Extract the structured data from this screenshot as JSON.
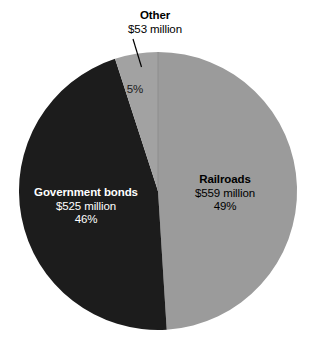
{
  "chart_data": {
    "type": "pie",
    "title": "",
    "subtitle": "",
    "xlabel": "",
    "ylabel": "",
    "legend_position": "none",
    "grid": false,
    "units": "million USD",
    "total_value": 1137,
    "start_angle_deg": 0,
    "direction": "clockwise",
    "categories": [
      "Railroads",
      "Government bonds",
      "Other"
    ],
    "values": [
      559,
      525,
      53
    ],
    "percentages": [
      49,
      46,
      5
    ],
    "colors": [
      "#9b9b9b",
      "#1c1c1c",
      "#a2a2a2"
    ],
    "slices": [
      {
        "name": "Railroads",
        "value": 559,
        "value_label": "$559 million",
        "percent": 49,
        "percent_label": "49%",
        "color": "#9b9b9b",
        "label_color": "#000000",
        "label_placement": "inside"
      },
      {
        "name": "Government bonds",
        "value": 525,
        "value_label": "$525 million",
        "percent": 46,
        "percent_label": "46%",
        "color": "#1c1c1c",
        "label_color": "#ffffff",
        "label_placement": "inside"
      },
      {
        "name": "Other",
        "value": 53,
        "value_label": "$53 million",
        "percent": 5,
        "percent_label": "5%",
        "color": "#a2a2a2",
        "label_color": "#000000",
        "label_placement": "outside-with-leader-line"
      }
    ]
  },
  "labels": {
    "other": {
      "title": "Other",
      "value": "$53 million",
      "percent": "5%"
    },
    "railroads": {
      "title": "Railroads",
      "value": "$559 million",
      "percent": "49%"
    },
    "government_bonds": {
      "title": "Government bonds",
      "value": "$525 million",
      "percent": "46%"
    }
  },
  "style": {
    "background": "#ffffff",
    "leader_line_color": "#000000"
  }
}
